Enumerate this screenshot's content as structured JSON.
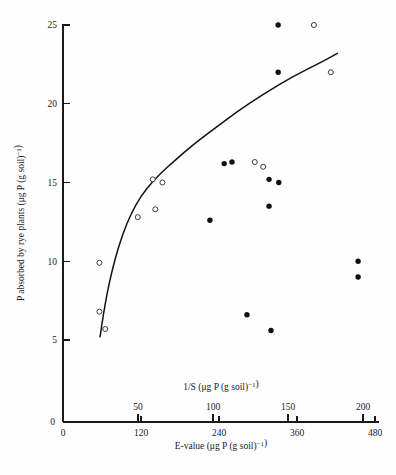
{
  "chart_data": {
    "type": "scatter",
    "title": "",
    "subtitle": "",
    "ylabel": "P absorbed by rye plants (μg P (g soil)⁻¹)",
    "xlabel": "E-value (μg P (g soil)⁻¹)",
    "xlabel_top": "1/S (μg P (g soil)⁻¹)",
    "ylim": [
      0,
      26.2
    ],
    "yticks": [
      5,
      10,
      15,
      20,
      25
    ],
    "ytick_labels": [
      "5",
      "10",
      "15",
      "20",
      "25"
    ],
    "xlim": [
      0,
      500
    ],
    "xticks": [
      0,
      120,
      240,
      360,
      480
    ],
    "xtick_labels": [
      "0",
      "120",
      "240",
      "360",
      "480"
    ],
    "xlim_top": [
      0,
      208
    ],
    "xticks_top": [
      50,
      100,
      150,
      200
    ],
    "xtick_labels_top": [
      "50",
      "100",
      "150",
      "200"
    ],
    "grid": false,
    "legend_position": "none",
    "series": [
      {
        "name": "filled-circles",
        "marker": "filled-circle",
        "color": "#111111",
        "points": [
          {
            "x": 331,
            "y": 25.0
          },
          {
            "x": 331,
            "y": 22.0
          },
          {
            "x": 260,
            "y": 16.3
          },
          {
            "x": 248,
            "y": 16.2
          },
          {
            "x": 317,
            "y": 15.2
          },
          {
            "x": 332,
            "y": 15.0
          },
          {
            "x": 317,
            "y": 13.5
          },
          {
            "x": 226,
            "y": 12.6
          },
          {
            "x": 283,
            "y": 6.6
          },
          {
            "x": 320,
            "y": 5.6
          },
          {
            "x": 454,
            "y": 10.0
          },
          {
            "x": 454,
            "y": 9.0
          }
        ]
      },
      {
        "name": "open-circles",
        "marker": "open-circle",
        "color": "#ffffff",
        "points": [
          {
            "x": 386,
            "y": 25.0
          },
          {
            "x": 412,
            "y": 22.0
          },
          {
            "x": 295,
            "y": 16.3
          },
          {
            "x": 308,
            "y": 16.0
          },
          {
            "x": 138,
            "y": 15.2
          },
          {
            "x": 153,
            "y": 15.0
          },
          {
            "x": 142,
            "y": 13.3
          },
          {
            "x": 115,
            "y": 12.8
          },
          {
            "x": 56,
            "y": 9.9
          },
          {
            "x": 56,
            "y": 6.8
          },
          {
            "x": 65,
            "y": 5.7
          }
        ]
      }
    ],
    "fit_curve": {
      "name": "fitted-curve",
      "description": "Monotonic saturating curve through open-circle data",
      "points": [
        {
          "x": 57,
          "y": 5.2
        },
        {
          "x": 62,
          "y": 6.6
        },
        {
          "x": 68,
          "y": 8.0
        },
        {
          "x": 76,
          "y": 9.5
        },
        {
          "x": 86,
          "y": 11.0
        },
        {
          "x": 98,
          "y": 12.4
        },
        {
          "x": 112,
          "y": 13.6
        },
        {
          "x": 128,
          "y": 14.6
        },
        {
          "x": 148,
          "y": 15.5
        },
        {
          "x": 172,
          "y": 16.4
        },
        {
          "x": 200,
          "y": 17.4
        },
        {
          "x": 232,
          "y": 18.4
        },
        {
          "x": 268,
          "y": 19.5
        },
        {
          "x": 308,
          "y": 20.6
        },
        {
          "x": 352,
          "y": 21.7
        },
        {
          "x": 400,
          "y": 22.7
        },
        {
          "x": 422,
          "y": 23.2
        }
      ]
    }
  }
}
